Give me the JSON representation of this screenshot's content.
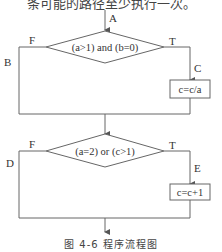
{
  "header_text": "条可能的路径至少执行一次。",
  "flowchart": {
    "entry_label": "A",
    "decision1": {
      "condition": "(a>1) and (b=0)",
      "false_label": "F",
      "true_label": "T",
      "false_path_label": "B",
      "true_path_label": "C"
    },
    "process1": {
      "text": "c=c/a"
    },
    "decision2": {
      "condition": "(a=2) or (c>1)",
      "false_label": "F",
      "true_label": "T",
      "false_path_label": "D",
      "true_path_label": "E"
    },
    "process2": {
      "text": "c=c+1"
    }
  },
  "caption": "图 4-6   程序流程图",
  "colors": {
    "line": "#555555",
    "text": "#333333",
    "background": "#ffffff"
  }
}
